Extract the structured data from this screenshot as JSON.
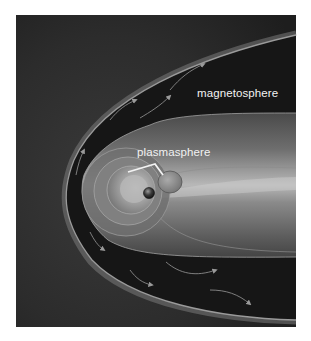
{
  "diagram": {
    "labels": {
      "magnetosphere": "magnetosphere",
      "plasmasphere": "plasmasphere"
    },
    "colors": {
      "page_background": "#ffffff",
      "space_background": "#2a2a2a",
      "bow_shock_edge": "#8a8a8a",
      "magnetosheath": "#1a1a1a",
      "magnetosphere_fill": "#6a6a6a",
      "magnetotail_highlight": "#b5b5b5",
      "plasmasphere_fill": "#9a9a9a",
      "label_text": "#f2f2f2",
      "earth": "#222222"
    },
    "elements": [
      {
        "name": "bow-shock",
        "shape": "parabolic boundary opening to the right"
      },
      {
        "name": "magnetosheath-flow-arrows",
        "count": 8
      },
      {
        "name": "magnetopause",
        "shape": "inner boundary with elongated magnetotail"
      },
      {
        "name": "plasmasphere",
        "shape": "concentric shells around Earth"
      },
      {
        "name": "earth",
        "shape": "small sphere"
      },
      {
        "name": "plasmasphere-bracket",
        "shape": "white bracket pointing to plasmasphere"
      }
    ]
  }
}
